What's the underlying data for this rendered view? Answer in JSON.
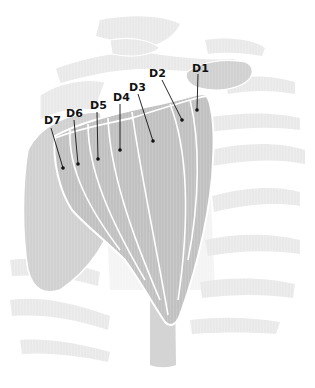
{
  "diagram": {
    "colors": {
      "background": "#ffffff",
      "skeleton": "#ececec",
      "skeleton_dark": "#e2e2e2",
      "muscle": "#c8c8c8",
      "muscle_fiber": "#b4b4b4",
      "muscle_outline": "#ffffff",
      "pointer": "#111111"
    },
    "labels": [
      {
        "id": "D1",
        "text": "D1",
        "x": 196,
        "y": 70,
        "dot_x": 197,
        "dot_y": 110
      },
      {
        "id": "D2",
        "text": "D2",
        "x": 149,
        "y": 76,
        "dot_x": 182,
        "dot_y": 120
      },
      {
        "id": "D3",
        "text": "D3",
        "x": 129,
        "y": 91,
        "dot_x": 153,
        "dot_y": 141
      },
      {
        "id": "D4",
        "text": "D4",
        "x": 114,
        "y": 102,
        "dot_x": 120,
        "dot_y": 150
      },
      {
        "id": "D5",
        "text": "D5",
        "x": 90,
        "y": 110,
        "dot_x": 98,
        "dot_y": 159
      },
      {
        "id": "D6",
        "text": "D6",
        "x": 67,
        "y": 117,
        "dot_x": 78,
        "dot_y": 164
      },
      {
        "id": "D7",
        "text": "D7",
        "x": 44,
        "y": 124,
        "dot_x": 63,
        "dot_y": 168
      }
    ]
  }
}
